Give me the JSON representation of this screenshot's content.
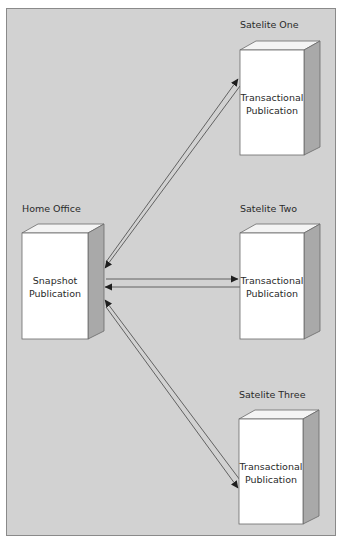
{
  "diagram": {
    "type": "network-topology",
    "colors": {
      "panel_background": "#d2d2d2",
      "panel_border": "#8a8a8a",
      "box_front": "#ffffff",
      "box_top": "#f4f4f4",
      "box_side": "#a9a9a9",
      "box_outline": "#6a6a6a",
      "connector": "#555555"
    },
    "nodes": [
      {
        "id": "home",
        "title": "Home Office",
        "lines": [
          "Snapshot",
          "Publication"
        ]
      },
      {
        "id": "sat1",
        "title": "Satelite One",
        "lines": [
          "Transactional",
          "Publication"
        ]
      },
      {
        "id": "sat2",
        "title": "Satelite Two",
        "lines": [
          "Transactional",
          "Publication"
        ]
      },
      {
        "id": "sat3",
        "title": "Satelite Three",
        "lines": [
          "Transactional",
          "Publication"
        ]
      }
    ],
    "edges": [
      {
        "from": "home",
        "to": "sat1",
        "direction": "to"
      },
      {
        "from": "sat1",
        "to": "home",
        "direction": "to"
      },
      {
        "from": "home",
        "to": "sat2",
        "direction": "to"
      },
      {
        "from": "sat2",
        "to": "home",
        "direction": "to"
      },
      {
        "from": "home",
        "to": "sat3",
        "direction": "to"
      },
      {
        "from": "sat3",
        "to": "home",
        "direction": "to"
      }
    ]
  }
}
